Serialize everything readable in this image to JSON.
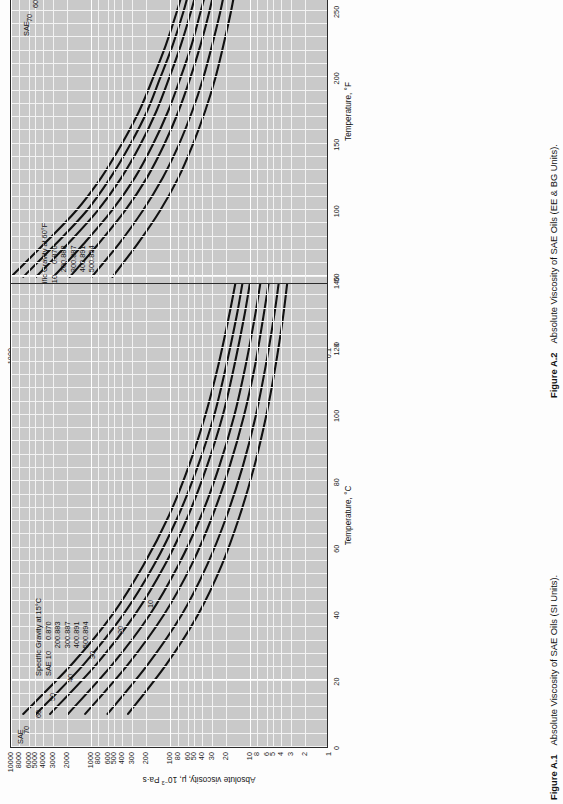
{
  "page": {
    "orientation": "rotated-90-ccw",
    "background": "#fdfdfd",
    "plot_background": "#c9c9c9",
    "grid_color": "#ffffff",
    "line_color": "#111111"
  },
  "figures": [
    {
      "id": "A2",
      "caption_number": "Figure A.2",
      "caption_text": "Absolute Viscosity of SAE Oils (EE & BG Units).",
      "legend_title": "Specific Gravity at 60°F",
      "legend_rows": [
        {
          "sae": "SAE 10",
          "sg": "0.870"
        },
        {
          "sae": "20",
          "sg": "0.883"
        },
        {
          "sae": "30",
          "sg": "0.887"
        },
        {
          "sae": "40",
          "sg": "0.891"
        },
        {
          "sae": "50",
          "sg": "0.894"
        }
      ],
      "series_header": "SAE",
      "series_labels": [
        "70",
        "60",
        "50",
        "40",
        "30",
        "20",
        "10"
      ],
      "chart_data": {
        "type": "line",
        "title": "Absolute Viscosity of SAE Oils (EE & BG Units)",
        "xlabel": "Temperature, °F",
        "ylabel": "Absolute viscosity, μ, 10⁻⁶ lb-sec/in²",
        "xscale": "linear",
        "yscale": "log",
        "xlim": [
          0,
          350
        ],
        "ylim": [
          0.1,
          1000
        ],
        "grid": true,
        "legend_position": "inside-upper-left",
        "xticks": [
          0,
          50,
          100,
          150,
          200,
          250,
          300,
          350
        ],
        "xticklabels": [
          "0",
          "50",
          "100",
          "150",
          "200",
          "250",
          "300",
          "350"
        ],
        "yticks": [
          1000,
          800,
          600,
          500,
          400,
          300,
          200,
          100,
          80,
          60,
          50,
          40,
          30,
          20,
          10,
          8,
          6,
          5,
          4,
          3,
          2,
          1.0,
          0.8,
          0.6,
          0.5,
          0.4,
          0.3,
          0.2,
          0.1
        ],
        "yticklabels": [
          "1000",
          "800",
          "600",
          "500",
          "400",
          "300",
          "200",
          "100",
          "80",
          "60",
          "50",
          "40",
          "30",
          "20",
          "10",
          "8",
          "6",
          "5",
          "4",
          "3",
          "2",
          "1.0",
          "0.8",
          "0.6",
          "0.5",
          "0.4",
          "0.3",
          "0.2",
          "0.1"
        ],
        "series": [
          {
            "name": "SAE 70",
            "x": [
              50,
              75,
              100,
              125,
              150,
              175,
              200,
              225,
              250,
              275,
              300
            ],
            "y": [
              1000,
              380,
              150,
              72,
              40,
              24,
              16,
              11,
              8.0,
              6.1,
              4.8
            ]
          },
          {
            "name": "SAE 60",
            "x": [
              50,
              75,
              100,
              125,
              150,
              175,
              200,
              225,
              250,
              275,
              300
            ],
            "y": [
              700,
              270,
              110,
              55,
              31,
              19,
              13,
              9.0,
              6.6,
              5.1,
              4.0
            ]
          },
          {
            "name": "SAE 50",
            "x": [
              50,
              75,
              100,
              125,
              150,
              175,
              200,
              225,
              250,
              275,
              300
            ],
            "y": [
              480,
              190,
              80,
              40,
              23,
              14.5,
              10.0,
              7.1,
              5.3,
              4.1,
              3.3
            ]
          },
          {
            "name": "SAE 40",
            "x": [
              50,
              75,
              100,
              125,
              150,
              175,
              200,
              225,
              250,
              275,
              300
            ],
            "y": [
              290,
              120,
              53,
              27,
              16.0,
              10.3,
              7.2,
              5.2,
              4.0,
              3.1,
              2.5
            ]
          },
          {
            "name": "SAE 30",
            "x": [
              50,
              75,
              100,
              125,
              150,
              175,
              200,
              225,
              250,
              275,
              300
            ],
            "y": [
              180,
              78,
              36,
              19.0,
              11.5,
              7.6,
              5.4,
              4.0,
              3.1,
              2.5,
              2.05
            ]
          },
          {
            "name": "SAE 20",
            "x": [
              50,
              75,
              100,
              125,
              150,
              175,
              200,
              225,
              250,
              275,
              300
            ],
            "y": [
              95,
              43,
              21.5,
              12.0,
              7.5,
              5.1,
              3.7,
              2.85,
              2.25,
              1.85,
              1.55
            ]
          },
          {
            "name": "SAE 10",
            "x": [
              50,
              75,
              100,
              125,
              150,
              175,
              200,
              225,
              250,
              275,
              300
            ],
            "y": [
              52,
              25,
              13.0,
              7.6,
              5.0,
              3.5,
              2.6,
              2.05,
              1.65,
              1.38,
              1.18
            ]
          }
        ]
      }
    },
    {
      "id": "A1",
      "caption_number": "Figure A.1",
      "caption_text": "Absolute Viscosity of SAE Oils (SI Units).",
      "legend_title": "Specific Gravity at 15°C",
      "legend_rows": [
        {
          "sae": "SAE 10",
          "sg": "0.870"
        },
        {
          "sae": "20",
          "sg": "0.883"
        },
        {
          "sae": "30",
          "sg": "0.887"
        },
        {
          "sae": "40",
          "sg": "0.891"
        },
        {
          "sae": "50",
          "sg": "0.894"
        }
      ],
      "series_header": "SAE",
      "series_labels": [
        "70",
        "60",
        "50",
        "40",
        "30",
        "20",
        "10"
      ],
      "chart_data": {
        "type": "line",
        "title": "Absolute Viscosity of SAE Oils (SI Units)",
        "xlabel": "Temperature, °C",
        "ylabel": "Absolute viscosity, μ, 10⁻³ Pa·s",
        "xscale": "linear",
        "yscale": "log",
        "xlim": [
          0,
          140
        ],
        "ylim": [
          1,
          10000
        ],
        "grid": true,
        "legend_position": "inside-upper-right",
        "xticks": [
          0,
          20,
          40,
          60,
          80,
          100,
          120,
          140
        ],
        "xticklabels": [
          "0",
          "20",
          "40",
          "60",
          "80",
          "100",
          "120",
          "140"
        ],
        "yticks": [
          10000,
          8000,
          6000,
          5000,
          4000,
          3000,
          2000,
          1000,
          800,
          600,
          500,
          400,
          300,
          200,
          100,
          80,
          60,
          50,
          40,
          30,
          20,
          10,
          8,
          6,
          5,
          4,
          3,
          2,
          1
        ],
        "yticklabels": [
          "10000",
          "8000",
          "6000",
          "5000",
          "4000",
          "3000",
          "2000",
          "1000",
          "800",
          "600",
          "500",
          "400",
          "300",
          "200",
          "100",
          "80",
          "60",
          "50",
          "40",
          "30",
          "20",
          "10",
          "8",
          "6",
          "5",
          "4",
          "3",
          "2",
          "1"
        ],
        "series": [
          {
            "name": "SAE 70",
            "x": [
              10,
              25,
              40,
              55,
              70,
              85,
              100,
              115,
              130,
              140
            ],
            "y": [
              7000,
              1700,
              520,
              210,
              100,
              56,
              35,
              24,
              17.5,
              14.5
            ]
          },
          {
            "name": "SAE 60",
            "x": [
              10,
              25,
              40,
              55,
              70,
              85,
              100,
              115,
              130,
              140
            ],
            "y": [
              4800,
              1200,
              380,
              155,
              76,
              43,
              27,
              19,
              14.0,
              11.8
            ]
          },
          {
            "name": "SAE 50",
            "x": [
              10,
              25,
              40,
              55,
              70,
              85,
              100,
              115,
              130,
              140
            ],
            "y": [
              3200,
              830,
              270,
              113,
              57,
              33,
              21,
              15.0,
              11.2,
              9.5
            ]
          },
          {
            "name": "SAE 40",
            "x": [
              10,
              25,
              40,
              55,
              70,
              85,
              100,
              115,
              130,
              140
            ],
            "y": [
              1900,
              520,
              175,
              76,
              39,
              23,
              15.0,
              10.8,
              8.2,
              7.0
            ]
          },
          {
            "name": "SAE 30",
            "x": [
              10,
              25,
              40,
              55,
              70,
              85,
              100,
              115,
              130,
              140
            ],
            "y": [
              1150,
              330,
              116,
              52,
              28,
              17.0,
              11.3,
              8.2,
              6.4,
              5.5
            ]
          },
          {
            "name": "SAE 20",
            "x": [
              10,
              25,
              40,
              55,
              70,
              85,
              100,
              115,
              130,
              140
            ],
            "y": [
              600,
              185,
              69,
              33,
              18.5,
              11.6,
              8.0,
              6.0,
              4.7,
              4.1
            ]
          },
          {
            "name": "SAE 10",
            "x": [
              10,
              25,
              40,
              55,
              70,
              85,
              100,
              115,
              130,
              140
            ],
            "y": [
              330,
              108,
              43,
              21.5,
              12.7,
              8.3,
              5.9,
              4.5,
              3.6,
              3.2
            ]
          }
        ]
      }
    }
  ]
}
